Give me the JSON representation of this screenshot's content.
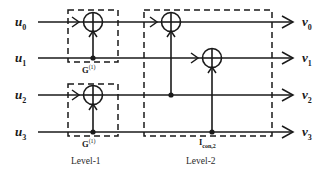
{
  "figure": {
    "type": "polar-code-encoder-circuit",
    "background_color": "#ffffff",
    "line_color": "#1a1a1a"
  },
  "inputs": [
    {
      "name": "u0",
      "base": "u",
      "sub": "0",
      "y": 22
    },
    {
      "name": "u1",
      "base": "u",
      "sub": "1",
      "y": 58
    },
    {
      "name": "u2",
      "base": "u",
      "sub": "2",
      "y": 95
    },
    {
      "name": "u3",
      "base": "u",
      "sub": "3",
      "y": 132
    }
  ],
  "outputs": [
    {
      "name": "v0",
      "base": "v",
      "sub": "0",
      "y": 22
    },
    {
      "name": "v1",
      "base": "v",
      "sub": "1",
      "y": 58
    },
    {
      "name": "v2",
      "base": "v",
      "sub": "2",
      "y": 95
    },
    {
      "name": "v3",
      "base": "v",
      "sub": "3",
      "y": 132
    }
  ],
  "gate_labels": [
    {
      "id": "g1-top",
      "base": "G",
      "sup": "(1)",
      "x": 93,
      "y": 66
    },
    {
      "id": "g1-bottom",
      "base": "G",
      "sup": "(1)",
      "x": 93,
      "y": 140
    },
    {
      "id": "icon2",
      "base": "I",
      "sub": "con,2",
      "x": 212,
      "y": 141
    }
  ],
  "level_labels": [
    {
      "id": "level-1",
      "text": "Level-1",
      "x": 93,
      "y": 160
    },
    {
      "id": "level-2",
      "text": "Level-2",
      "x": 208,
      "y": 160
    }
  ],
  "dashed_boxes": [
    {
      "id": "level-1-box-top",
      "x": 68,
      "y": 10,
      "w": 50,
      "h": 52
    },
    {
      "id": "level-1-box-bottom",
      "x": 68,
      "y": 84,
      "w": 50,
      "h": 52
    },
    {
      "id": "level-2-box",
      "x": 144,
      "y": 10,
      "w": 128,
      "h": 126
    }
  ],
  "xor_gates": [
    {
      "id": "xor-l1-top",
      "cx": 93,
      "cy": 22,
      "r": 9.5,
      "control_from_y": 58
    },
    {
      "id": "xor-l1-bottom",
      "cx": 93,
      "cy": 95,
      "r": 9.5,
      "control_from_y": 132
    },
    {
      "id": "xor-l2-v0",
      "cx": 171,
      "cy": 22,
      "r": 9.5,
      "control_from_y": 95
    },
    {
      "id": "xor-l2-v1",
      "cx": 212,
      "cy": 58,
      "r": 9.5,
      "control_from_y": 132
    }
  ],
  "junction_dots": [
    {
      "id": "dot-u1-l1",
      "cx": 93,
      "cy": 58
    },
    {
      "id": "dot-u3-l1",
      "cx": 93,
      "cy": 132
    },
    {
      "id": "dot-u2-l2",
      "cx": 171,
      "cy": 95
    },
    {
      "id": "dot-u3-l2",
      "cx": 212,
      "cy": 132
    }
  ],
  "horizontal_wires": [
    {
      "id": "wire-row-0",
      "y": 22,
      "x1": 38,
      "x2": 292
    },
    {
      "id": "wire-row-1",
      "y": 58,
      "x1": 38,
      "x2": 292
    },
    {
      "id": "wire-row-2",
      "y": 95,
      "x1": 38,
      "x2": 292
    },
    {
      "id": "wire-row-3",
      "y": 132,
      "x1": 38,
      "x2": 292
    }
  ]
}
